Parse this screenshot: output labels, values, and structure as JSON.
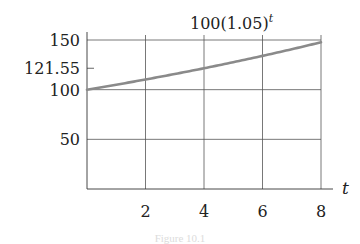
{
  "chart_data": {
    "type": "line",
    "title": "",
    "curve_label": "100(1.05)",
    "curve_label_exponent": "t",
    "xlabel": "t",
    "ylabel": "",
    "xlim": [
      0,
      8
    ],
    "ylim": [
      0,
      150
    ],
    "x_ticks": [
      2,
      4,
      6,
      8
    ],
    "x_tick_labels": [
      "2",
      "4",
      "6",
      "8"
    ],
    "y_ticks": [
      50,
      100,
      121.55,
      150
    ],
    "y_tick_labels": [
      "50",
      "100",
      "121.55",
      "150"
    ],
    "grid": true,
    "series": [
      {
        "name": "100(1.05)^t",
        "x": [
          0,
          1,
          2,
          3,
          4,
          5,
          6,
          7,
          8
        ],
        "values": [
          100,
          105,
          110.25,
          115.76,
          121.55,
          127.63,
          134.01,
          140.71,
          147.75
        ]
      }
    ],
    "line_color": "#8a8a8a",
    "grid_color": "#555555"
  },
  "caption": "Figure 10.1"
}
